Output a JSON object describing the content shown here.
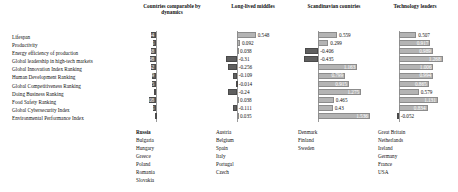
{
  "chart_data": {
    "type": "bar",
    "title": "",
    "xlabel": "",
    "ylabel": "",
    "grid": false,
    "legend": "none",
    "orientation": "horizontal",
    "xlim": [
      -0.6,
      1.6
    ],
    "categories": [
      "Lifespan",
      "Productivity",
      "Energy efficiency of production",
      "Global leadership in high-tech markets",
      "Global Innovation Index Ranking",
      "Human Development Ranking",
      "Global Competitiveness Ranking",
      "Doing Business Ranking",
      "Food Safety Ranking",
      "Global Cybersecurity Index",
      "Environmental Performance Index"
    ],
    "series": [
      {
        "name": "Countries comparable by dynamics",
        "values": [
          -0.144,
          -0.095,
          -0.168,
          -0.198,
          -0.142,
          -0.139,
          -0.135,
          -0.071,
          -0.208,
          -0.085,
          -0.043
        ]
      },
      {
        "name": "Long-lived middles",
        "values": [
          0.548,
          0.092,
          0.038,
          -0.31,
          -0.256,
          -0.109,
          -0.014,
          -0.24,
          0.038,
          -0.111,
          0.035
        ]
      },
      {
        "name": "Scandinavian countries",
        "values": [
          0.559,
          0.299,
          -0.406,
          -0.435,
          1.163,
          0.799,
          0.915,
          1.275,
          0.465,
          0.43,
          1.536
        ]
      },
      {
        "name": "Technology leaders",
        "values": [
          0.507,
          0.917,
          0.989,
          1.268,
          1.006,
          0.994,
          0.865,
          0.579,
          1.131,
          0.834,
          -0.052
        ]
      }
    ]
  },
  "columns": [
    {
      "header": "Countries comparable by dynamics",
      "countries": [
        "Russia",
        "Bulgaria",
        "Hungary",
        "Greece",
        "Poland",
        "Romania",
        "Slovakia"
      ],
      "bold_first": true
    },
    {
      "header": "Long-lived middles",
      "countries": [
        "Austria",
        "Belgium",
        "Spain",
        "Italy",
        "Portugal",
        "Czech"
      ],
      "bold_first": false
    },
    {
      "header": "Scandinavian countries",
      "countries": [
        "Denmark",
        "Finland",
        "Sweden"
      ],
      "bold_first": false
    },
    {
      "header": "Technology leaders",
      "countries": [
        "Great Britain",
        "Netherlands",
        "Ireland",
        "Germany",
        "France",
        "USA"
      ],
      "bold_first": false
    }
  ],
  "colors": {
    "bar_light": "#b4b4b4",
    "bar_dark": "#5f5f5f",
    "axis": "#9a9a9a",
    "text": "#111111",
    "value_inside": "#ffffff"
  }
}
